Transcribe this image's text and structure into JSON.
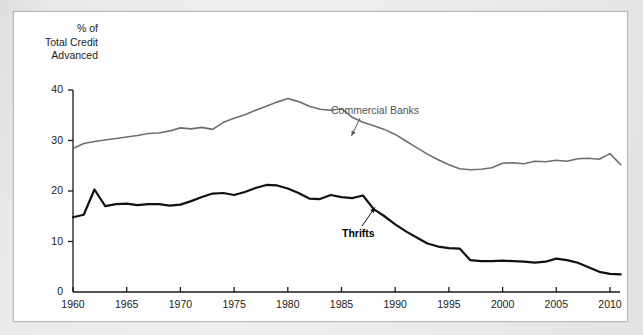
{
  "figure": {
    "axis_title": "% of\nTotal Credit\nAdvanced",
    "background_color": "#e9e9e7",
    "panel_color": "#fefefe"
  },
  "labels": {
    "commercial_banks": "Commercial Banks",
    "thrifts": "Thrifts"
  },
  "chart_data": {
    "type": "line",
    "title": "",
    "subtitle": "",
    "xlabel": "",
    "ylabel": "% of Total Credit Advanced",
    "xlim": [
      1960,
      2011.5
    ],
    "ylim": [
      0,
      40
    ],
    "grid": false,
    "legend": "inline-annotations",
    "xticks": [
      1960,
      1965,
      1970,
      1975,
      1980,
      1985,
      1990,
      1995,
      2000,
      2005,
      2010
    ],
    "xtick_labels": [
      "1960",
      "1965",
      "1970",
      "1975",
      "1980",
      "1985",
      "1990",
      "1995",
      "2000",
      "2005",
      "2010"
    ],
    "yticks": [
      0,
      10,
      20,
      30,
      40
    ],
    "ytick_labels": [
      "0",
      "10",
      "20",
      "30",
      "40"
    ],
    "annotations": [
      {
        "text": "Commercial Banks",
        "target_x": 1990,
        "target_y": 28.5,
        "color": "#595959"
      },
      {
        "text": "Thrifts",
        "target_x": 1988,
        "target_y": 16.5,
        "color": "#000000"
      }
    ],
    "x": [
      1960,
      1961,
      1962,
      1963,
      1964,
      1965,
      1966,
      1967,
      1968,
      1969,
      1970,
      1971,
      1972,
      1973,
      1974,
      1975,
      1976,
      1977,
      1978,
      1979,
      1980,
      1981,
      1982,
      1983,
      1984,
      1985,
      1986,
      1987,
      1988,
      1989,
      1990,
      1991,
      1992,
      1993,
      1994,
      1995,
      1996,
      1997,
      1998,
      1999,
      2000,
      2001,
      2002,
      2003,
      2004,
      2005,
      2006,
      2007,
      2008,
      2009,
      2010,
      2011
    ],
    "series": [
      {
        "name": "Commercial Banks",
        "color": "#6e6e6e",
        "width": 1.6,
        "values": [
          28.4,
          29.4,
          29.8,
          30.1,
          30.4,
          30.7,
          31.0,
          31.4,
          31.5,
          31.9,
          32.5,
          32.3,
          32.6,
          32.2,
          33.6,
          34.4,
          35.1,
          36.0,
          36.8,
          37.6,
          38.3,
          37.7,
          36.8,
          36.2,
          36.0,
          36.3,
          34.6,
          33.6,
          32.9,
          32.2,
          31.2,
          29.9,
          28.6,
          27.3,
          26.2,
          25.2,
          24.4,
          24.2,
          24.3,
          24.6,
          25.5,
          25.6,
          25.4,
          25.9,
          25.8,
          26.1,
          25.9,
          26.4,
          26.5,
          26.3,
          27.4,
          25.2
        ]
      },
      {
        "name": "Thrifts",
        "color": "#111111",
        "width": 2.2,
        "values": [
          14.8,
          15.3,
          20.3,
          17.0,
          17.4,
          17.5,
          17.2,
          17.4,
          17.4,
          17.1,
          17.3,
          18.0,
          18.8,
          19.5,
          19.6,
          19.2,
          19.8,
          20.6,
          21.2,
          21.1,
          20.5,
          19.6,
          18.5,
          18.4,
          19.2,
          18.8,
          18.6,
          19.1,
          16.4,
          15.0,
          13.4,
          12.0,
          10.8,
          9.6,
          9.0,
          8.7,
          8.6,
          6.3,
          6.1,
          6.1,
          6.2,
          6.1,
          6.0,
          5.8,
          6.0,
          6.6,
          6.3,
          5.8,
          4.9,
          4.0,
          3.6,
          3.5
        ]
      }
    ]
  }
}
